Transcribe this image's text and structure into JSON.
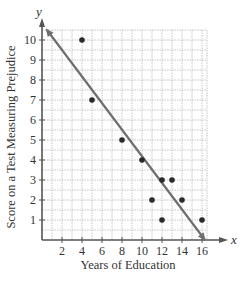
{
  "chart_data": {
    "type": "scatter",
    "title": "",
    "xlabel": "Years of Education",
    "ylabel": "Score on a Test Measuring Prejudice",
    "x_axis_var": "x",
    "y_axis_var": "y",
    "xlim": [
      0,
      16.5
    ],
    "ylim": [
      0,
      10.5
    ],
    "x_ticks": [
      2,
      4,
      6,
      8,
      10,
      12,
      14,
      16
    ],
    "y_ticks": [
      1,
      2,
      3,
      4,
      5,
      6,
      7,
      8,
      9,
      10
    ],
    "grid": true,
    "legend": "none",
    "series": [
      {
        "name": "Data points",
        "type": "scatter",
        "points": [
          {
            "x": 4,
            "y": 10
          },
          {
            "x": 5,
            "y": 7
          },
          {
            "x": 8,
            "y": 5
          },
          {
            "x": 10,
            "y": 4
          },
          {
            "x": 11,
            "y": 2
          },
          {
            "x": 12,
            "y": 3
          },
          {
            "x": 12,
            "y": 1
          },
          {
            "x": 13,
            "y": 3
          },
          {
            "x": 14,
            "y": 2
          },
          {
            "x": 16,
            "y": 1
          }
        ]
      },
      {
        "name": "Line of best fit",
        "type": "line",
        "points": [
          {
            "x": 0.5,
            "y": 10.5
          },
          {
            "x": 16.3,
            "y": 0
          }
        ]
      }
    ]
  },
  "colors": {
    "axis": "#555555",
    "grid": "#b8b8b8",
    "point": "#2a2a2a",
    "line": "#6e6e6e",
    "text": "#333333"
  }
}
